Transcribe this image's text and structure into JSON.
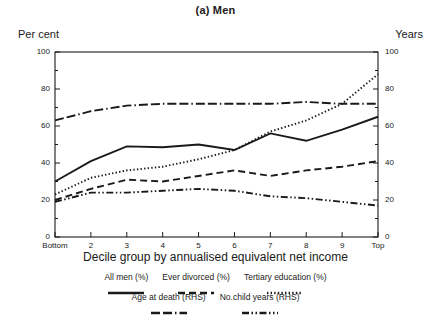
{
  "chart_data": {
    "type": "line",
    "title": "(a) Men",
    "xlabel": "Decile group by annualised equivalent net income",
    "ylabel": "Per cent",
    "y2label": "Years",
    "ylim": [
      0,
      100
    ],
    "y2lim": [
      0,
      100
    ],
    "grid": false,
    "legend_position": "below",
    "categories": [
      "Bottom",
      "2",
      "3",
      "4",
      "5",
      "6",
      "7",
      "8",
      "9",
      "Top"
    ],
    "yticks": [
      0,
      20,
      40,
      60,
      80,
      100
    ],
    "y2ticks": [
      0,
      20,
      40,
      60,
      80,
      100
    ],
    "series": [
      {
        "name": "All men (%)",
        "style": "solid",
        "axis": "left",
        "values": [
          30,
          41,
          49,
          48.5,
          50,
          47,
          56,
          52,
          58,
          65
        ]
      },
      {
        "name": "Ever divorced (%)",
        "style": "dashed",
        "axis": "left",
        "values": [
          20,
          26,
          31,
          30,
          33,
          36,
          33,
          36,
          38,
          41
        ]
      },
      {
        "name": "Tertiary education (%)",
        "style": "dotted",
        "axis": "left",
        "values": [
          23,
          32,
          36,
          38,
          42,
          47,
          57,
          63,
          72,
          88
        ]
      },
      {
        "name": "Age at death (RHS)",
        "style": "dash-dash-dot",
        "axis": "right",
        "values": [
          63,
          68,
          71,
          72,
          72,
          72,
          72,
          73,
          72,
          72
        ]
      },
      {
        "name": "No.child years (RHS)",
        "style": "dash-dot-dot",
        "axis": "right",
        "values": [
          19,
          24,
          24,
          25,
          26,
          25,
          22,
          21,
          19,
          17
        ]
      }
    ]
  },
  "figure": {
    "title": "(a) Men",
    "left_axis_name": "Per cent",
    "right_axis_name": "Years",
    "x_axis_title": "Decile group by annualised equivalent net income"
  },
  "legend": {
    "row1": [
      "All men (%)",
      "Ever divorced (%)",
      "Tertiary education (%)"
    ],
    "row2": [
      "Age at death (RHS)",
      "No.child years (RHS)"
    ]
  }
}
